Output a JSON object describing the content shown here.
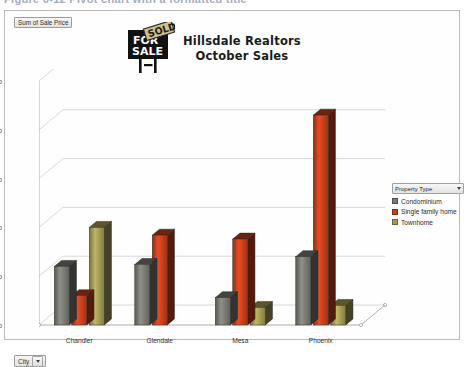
{
  "caption": {
    "text": "Figure  6-12    Pivot chart with a formatted title"
  },
  "chart": {
    "value_field_label": "Sum of Sale Price",
    "city_field_label": "City",
    "title_line1": "Hillsdale Realtors",
    "title_line2": "October Sales",
    "logo_sign_text_line1": "FOR",
    "logo_sign_text_line2": "SALE",
    "logo_banner_text": "SOLD"
  },
  "legend": {
    "title": "Property Type",
    "items": [
      {
        "label": "Condominium",
        "color": "#7a7a74"
      },
      {
        "label": "Single family home",
        "color": "#c5401d"
      },
      {
        "label": "Townhome",
        "color": "#a39a55"
      }
    ]
  },
  "chart_data": {
    "type": "bar",
    "title": "Hillsdale Realtors October Sales",
    "xlabel": "City",
    "ylabel": "Sum of Sale Price",
    "categories": [
      "Chandler",
      "Glendale",
      "Mesa",
      "Phoenix"
    ],
    "series": [
      {
        "name": "Condominium",
        "color": "#7a7a74",
        "values": [
          600000,
          620000,
          280000,
          700000
        ]
      },
      {
        "name": "Single family home",
        "color": "#c5401d",
        "values": [
          300000,
          920000,
          880000,
          2150000
        ]
      },
      {
        "name": "Townhome",
        "color": "#a39a55",
        "values": [
          1000000,
          0,
          180000,
          200000
        ]
      }
    ],
    "ylim": [
      0,
      2500000
    ],
    "yticks": [
      0,
      500000,
      1000000,
      1500000,
      2000000,
      2500000
    ],
    "ytick_labels": [
      "0",
      "500000",
      "1000000",
      "1500000",
      "2000000",
      "2500000"
    ],
    "grid": true,
    "legend_position": "right",
    "three_d": true
  }
}
